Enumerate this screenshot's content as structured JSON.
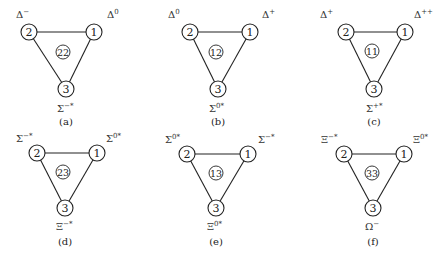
{
  "figure": {
    "node_labels": [
      "1",
      "2",
      "3"
    ],
    "panels": [
      {
        "caption": "(a)",
        "center": "22",
        "top_left": {
          "base": "Δ",
          "sup": "−"
        },
        "top_right": {
          "base": "Δ",
          "sup": "0"
        },
        "bottom": {
          "base": "Σ",
          "sup": "−*"
        }
      },
      {
        "caption": "(b)",
        "center": "12",
        "top_left": {
          "base": "Δ",
          "sup": "0"
        },
        "top_right": {
          "base": "Δ",
          "sup": "+"
        },
        "bottom": {
          "base": "Σ",
          "sup": "0*"
        }
      },
      {
        "caption": "(c)",
        "center": "11",
        "top_left": {
          "base": "Δ",
          "sup": "+"
        },
        "top_right": {
          "base": "Δ",
          "sup": "++"
        },
        "bottom": {
          "base": "Σ",
          "sup": "+*"
        }
      },
      {
        "caption": "(d)",
        "center": "23",
        "top_left": {
          "base": "Σ",
          "sup": "−*"
        },
        "top_right": {
          "base": "Σ",
          "sup": "0*"
        },
        "bottom": {
          "base": "Ξ",
          "sup": "−*"
        }
      },
      {
        "caption": "(e)",
        "center": "13",
        "top_left": {
          "base": "Σ",
          "sup": "0*"
        },
        "top_right": {
          "base": "Σ",
          "sup": "−*"
        },
        "bottom": {
          "base": "Ξ",
          "sup": "0*"
        }
      },
      {
        "caption": "(f)",
        "center": "33",
        "top_left": {
          "base": "Ξ",
          "sup": "−*"
        },
        "top_right": {
          "base": "Ξ",
          "sup": "0*"
        },
        "bottom": {
          "base": "Ω",
          "sup": "−"
        }
      }
    ]
  }
}
